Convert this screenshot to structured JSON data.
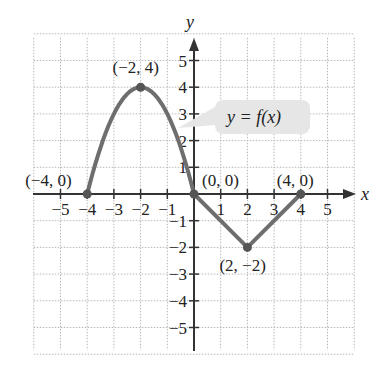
{
  "chart_data": {
    "type": "line",
    "title": "",
    "xlabel": "x",
    "ylabel": "y",
    "xlim": [
      -6,
      6
    ],
    "ylim": [
      -6,
      6
    ],
    "grid": true,
    "x_ticks": [
      "−5",
      "−4",
      "−3",
      "−2",
      "−1",
      "1",
      "2",
      "3",
      "4",
      "5"
    ],
    "y_ticks": [
      "5",
      "4",
      "3",
      "2",
      "1",
      "−1",
      "−2",
      "−3",
      "−4",
      "−5"
    ],
    "series": [
      {
        "name": "y = f(x)",
        "description": "parabolic arc from (-4,0) up to vertex (-2,4) down to (0,0), then line segments to (2,-2) and (4,0)",
        "x": [
          -4,
          -3,
          -2,
          -1,
          0,
          2,
          4
        ],
        "y": [
          0,
          3,
          4,
          3,
          0,
          -2,
          0
        ]
      }
    ],
    "annotations": [
      {
        "label": "(−4, 0)",
        "x": -4,
        "y": 0
      },
      {
        "label": "(−2, 4)",
        "x": -2,
        "y": 4
      },
      {
        "label": "(0, 0)",
        "x": 0,
        "y": 0
      },
      {
        "label": "(2, −2)",
        "x": 2,
        "y": -2
      },
      {
        "label": "(4, 0)",
        "x": 4,
        "y": 0
      }
    ],
    "callout": "y = f(x)",
    "colors": {
      "curve": "#6e6e6e",
      "callout_bg": "#e6e6e6",
      "grid": "#b8b8b8",
      "axis": "#333333"
    }
  }
}
